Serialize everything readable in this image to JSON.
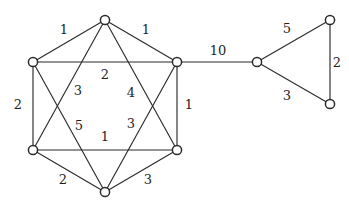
{
  "figure": {
    "type": "graph-diagram",
    "background_color": "#ffffff",
    "stroke_color": "#2b2b2b",
    "label_color": "#1f1f1f",
    "node_fill_color": "#ffffff",
    "node_radius": 4.6,
    "width": 349,
    "height": 216
  },
  "chart_data": {
    "type": "graph",
    "title": "",
    "xlabel": "",
    "ylabel": "",
    "directed": false,
    "weighted": true,
    "node_count": 9,
    "edge_count": 16,
    "nodes": [
      {
        "id": "n_top",
        "label": "",
        "x": 105,
        "y": 20,
        "group": "hexagon"
      },
      {
        "id": "n_upper_left",
        "label": "",
        "x": 33,
        "y": 62,
        "group": "hexagon"
      },
      {
        "id": "n_upper_right",
        "label": "",
        "x": 177,
        "y": 62,
        "group": "hexagon"
      },
      {
        "id": "n_lower_left",
        "label": "",
        "x": 33,
        "y": 150,
        "group": "hexagon"
      },
      {
        "id": "n_lower_right",
        "label": "",
        "x": 177,
        "y": 150,
        "group": "hexagon"
      },
      {
        "id": "n_bottom",
        "label": "",
        "x": 105,
        "y": 192,
        "group": "hexagon"
      },
      {
        "id": "t_left",
        "label": "",
        "x": 257,
        "y": 62,
        "group": "triangle"
      },
      {
        "id": "t_top",
        "label": "",
        "x": 330,
        "y": 20,
        "group": "triangle"
      },
      {
        "id": "t_bottom",
        "label": "",
        "x": 330,
        "y": 104,
        "group": "triangle"
      }
    ],
    "edges": [
      {
        "id": "e1",
        "source": "n_top",
        "target": "n_upper_left",
        "weight": "1",
        "label_x": 64,
        "label_y": 30,
        "kind": "hexagon-side"
      },
      {
        "id": "e2",
        "source": "n_top",
        "target": "n_upper_right",
        "weight": "1",
        "label_x": 146,
        "label_y": 30,
        "kind": "hexagon-side"
      },
      {
        "id": "e3",
        "source": "n_upper_left",
        "target": "n_lower_left",
        "weight": "2",
        "label_x": 18,
        "label_y": 105,
        "kind": "hexagon-side"
      },
      {
        "id": "e4",
        "source": "n_upper_right",
        "target": "n_lower_right",
        "weight": "1",
        "label_x": 189,
        "label_y": 105,
        "kind": "hexagon-side"
      },
      {
        "id": "e5",
        "source": "n_lower_left",
        "target": "n_bottom",
        "weight": "2",
        "label_x": 63,
        "label_y": 180,
        "kind": "hexagon-side"
      },
      {
        "id": "e6",
        "source": "n_lower_right",
        "target": "n_bottom",
        "weight": "3",
        "label_x": 148,
        "label_y": 180,
        "kind": "hexagon-side"
      },
      {
        "id": "e7",
        "source": "n_upper_left",
        "target": "n_upper_right",
        "weight": "2",
        "label_x": 105,
        "label_y": 75,
        "kind": "hexagram-chord"
      },
      {
        "id": "e8",
        "source": "n_lower_left",
        "target": "n_lower_right",
        "weight": "1",
        "label_x": 105,
        "label_y": 137,
        "kind": "hexagram-chord"
      },
      {
        "id": "e9",
        "source": "n_top",
        "target": "n_lower_left",
        "weight": "3",
        "label_x": 78,
        "label_y": 91,
        "kind": "hexagram-chord"
      },
      {
        "id": "e10",
        "source": "n_top",
        "target": "n_lower_right",
        "weight": "4",
        "label_x": 131,
        "label_y": 93,
        "kind": "hexagram-chord"
      },
      {
        "id": "e11",
        "source": "n_bottom",
        "target": "n_upper_left",
        "weight": "5",
        "label_x": 79,
        "label_y": 126,
        "kind": "hexagram-chord"
      },
      {
        "id": "e12",
        "source": "n_bottom",
        "target": "n_upper_right",
        "weight": "3",
        "label_x": 131,
        "label_y": 124,
        "kind": "hexagram-chord"
      },
      {
        "id": "e13",
        "source": "n_upper_right",
        "target": "t_left",
        "weight": "10",
        "label_x": 218,
        "label_y": 51,
        "kind": "bridge"
      },
      {
        "id": "e14",
        "source": "t_left",
        "target": "t_top",
        "weight": "5",
        "label_x": 287,
        "label_y": 29,
        "kind": "triangle-side"
      },
      {
        "id": "e15",
        "source": "t_top",
        "target": "t_bottom",
        "weight": "2",
        "label_x": 337,
        "label_y": 63,
        "kind": "triangle-side"
      },
      {
        "id": "e16",
        "source": "t_left",
        "target": "t_bottom",
        "weight": "3",
        "label_x": 287,
        "label_y": 96,
        "kind": "triangle-side"
      }
    ],
    "legend": [],
    "annotations": []
  }
}
